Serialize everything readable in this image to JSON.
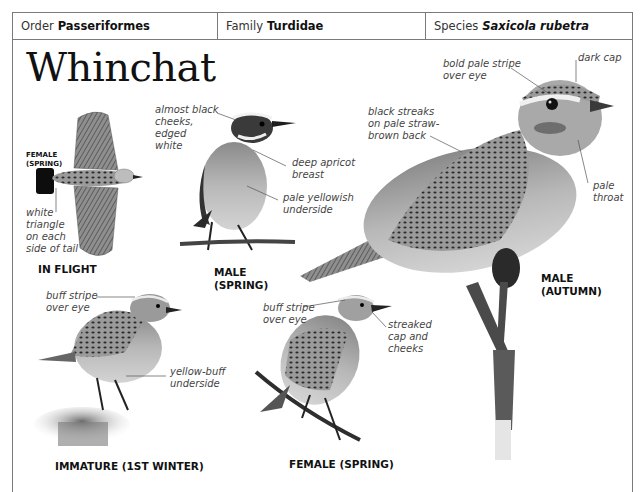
{
  "header": {
    "order": {
      "label": "Order",
      "value": "Passeriformes"
    },
    "family": {
      "label": "Family",
      "value": "Turdidae"
    },
    "species": {
      "label": "Species",
      "value": "Saxicola rubetra"
    }
  },
  "title": "Whinchat",
  "figures": [
    {
      "id": "in-flight",
      "caption": "IN FLIGHT",
      "sub_caption": "FEMALE\n(SPRING)",
      "annotations": [
        "white\ntriangle\non each\nside of tail"
      ]
    },
    {
      "id": "male-spring",
      "caption": "MALE\n(SPRING)",
      "annotations": [
        "almost black\ncheeks,\nedged\nwhite",
        "deep apricot\nbreast",
        "pale yellowish\nunderside"
      ]
    },
    {
      "id": "male-autumn",
      "caption": "MALE\n(AUTUMN)",
      "annotations": [
        "bold pale stripe\nover eye",
        "dark cap",
        "black streaks\non pale straw-\nbrown back",
        "pale\nthroat"
      ]
    },
    {
      "id": "immature",
      "caption": "IMMATURE (1ST WINTER)",
      "annotations": [
        "buff stripe\nover eye",
        "yellow-buff\nunderside"
      ]
    },
    {
      "id": "female-spring",
      "caption": "FEMALE (SPRING)",
      "annotations": [
        "buff stripe\nover eye",
        "streaked\ncap and\ncheeks"
      ]
    }
  ],
  "colors": {
    "border": "#7a7a7a",
    "text": "#1a1a1a",
    "annotation": "#444444"
  }
}
